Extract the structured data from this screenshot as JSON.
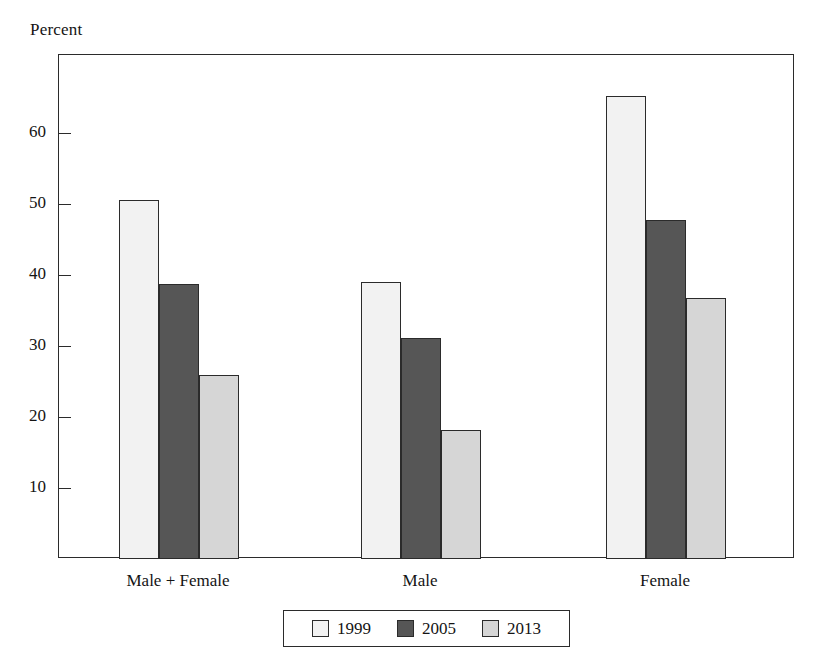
{
  "chart_data": {
    "type": "bar",
    "title": "",
    "subtitle": "",
    "ylabel": "Percent",
    "xlabel": "",
    "categories": [
      "Male + Female",
      "Male",
      "Female"
    ],
    "series": [
      {
        "name": "1999",
        "values": [
          50.6,
          39.0,
          65.2
        ],
        "color": "#f2f2f2"
      },
      {
        "name": "2005",
        "values": [
          38.7,
          31.1,
          47.7
        ],
        "color": "#565656"
      },
      {
        "name": "2013",
        "values": [
          25.9,
          18.1,
          36.7
        ],
        "color": "#d6d6d6"
      }
    ],
    "ylim": [
      0,
      70
    ],
    "yticks": [
      10,
      20,
      30,
      40,
      50,
      60
    ],
    "ytick_labels": [
      "10",
      "20",
      "30",
      "40",
      "50",
      "60"
    ],
    "grid": false,
    "legend_position": "bottom",
    "legend_entries": [
      "1999",
      "2005",
      "2013"
    ],
    "frame": true,
    "tick_direction": "in"
  },
  "axis": {
    "y_title": "Percent"
  },
  "colors": {
    "frame": "#2b2b2b",
    "bar_1999": "#f2f2f2",
    "bar_2005": "#565656",
    "bar_2013": "#d6d6d6",
    "text": "#141414",
    "background": "#ffffff"
  }
}
